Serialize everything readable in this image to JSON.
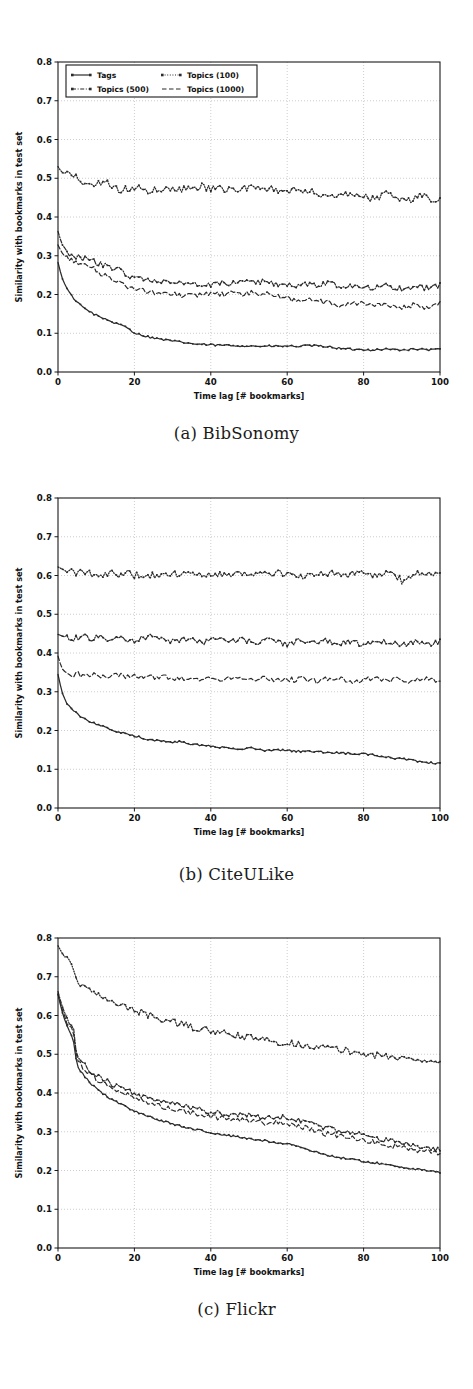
{
  "figure": {
    "panels": [
      {
        "id": "a",
        "caption": "(a) BibSonomy"
      },
      {
        "id": "b",
        "caption": "(b) CiteULike"
      },
      {
        "id": "c",
        "caption": "(c) Flickr"
      }
    ]
  },
  "axes": {
    "xlabel": "Time lag [# bookmarks]",
    "ylabel": "Similarity with bookmarks in test set",
    "xticks": [
      "0",
      "20",
      "40",
      "60",
      "80",
      "100"
    ],
    "yticks": [
      "0.0",
      "0.1",
      "0.2",
      "0.3",
      "0.4",
      "0.5",
      "0.6",
      "0.7",
      "0.8"
    ]
  },
  "legend": {
    "entries": [
      {
        "label": "Tags",
        "style": "solid-marker"
      },
      {
        "label": "Topics (100)",
        "style": "dotted-marker"
      },
      {
        "label": "Topics (500)",
        "style": "dashdot-marker"
      },
      {
        "label": "Topics (1000)",
        "style": "dashed"
      }
    ]
  },
  "colors": {
    "line": "#2b2b2b",
    "grid": "#b8b8b8",
    "frame": "#1a1a1a",
    "background": "#ffffff"
  },
  "chart_data": [
    {
      "type": "line",
      "title": "(a) BibSonomy",
      "xlabel": "Time lag [# bookmarks]",
      "ylabel": "Similarity with bookmarks in test set",
      "xlim": [
        0,
        100
      ],
      "ylim": [
        0.0,
        0.8
      ],
      "grid": true,
      "legend_position": "upper-left",
      "x": [
        0,
        1,
        2,
        3,
        4,
        5,
        6,
        7,
        8,
        9,
        10,
        12,
        14,
        16,
        18,
        20,
        22,
        24,
        26,
        28,
        30,
        32,
        34,
        36,
        38,
        40,
        42,
        44,
        46,
        48,
        50,
        52,
        54,
        56,
        58,
        60,
        62,
        64,
        66,
        68,
        70,
        72,
        74,
        76,
        78,
        80,
        82,
        84,
        86,
        88,
        90,
        92,
        94,
        96,
        98,
        100
      ],
      "series": [
        {
          "name": "Topics (100)",
          "values": [
            0.53,
            0.515,
            0.512,
            0.511,
            0.498,
            0.503,
            0.486,
            0.492,
            0.489,
            0.488,
            0.488,
            0.49,
            0.483,
            0.468,
            0.474,
            0.473,
            0.477,
            0.466,
            0.472,
            0.467,
            0.478,
            0.47,
            0.479,
            0.471,
            0.48,
            0.47,
            0.476,
            0.468,
            0.475,
            0.47,
            0.478,
            0.473,
            0.468,
            0.474,
            0.462,
            0.46,
            0.47,
            0.465,
            0.472,
            0.461,
            0.453,
            0.452,
            0.459,
            0.456,
            0.463,
            0.458,
            0.445,
            0.45,
            0.462,
            0.456,
            0.445,
            0.441,
            0.455,
            0.46,
            0.444,
            0.452
          ]
        },
        {
          "name": "Topics (500)",
          "values": [
            0.363,
            0.33,
            0.317,
            0.306,
            0.3,
            0.298,
            0.295,
            0.292,
            0.29,
            0.286,
            0.283,
            0.275,
            0.268,
            0.264,
            0.25,
            0.245,
            0.242,
            0.239,
            0.238,
            0.234,
            0.231,
            0.228,
            0.228,
            0.225,
            0.228,
            0.226,
            0.231,
            0.228,
            0.233,
            0.229,
            0.234,
            0.23,
            0.236,
            0.228,
            0.224,
            0.226,
            0.222,
            0.226,
            0.228,
            0.224,
            0.23,
            0.226,
            0.22,
            0.222,
            0.226,
            0.222,
            0.218,
            0.222,
            0.224,
            0.218,
            0.215,
            0.219,
            0.222,
            0.216,
            0.219,
            0.224
          ]
        },
        {
          "name": "Topics (1000)",
          "values": [
            0.328,
            0.308,
            0.296,
            0.29,
            0.287,
            0.283,
            0.28,
            0.275,
            0.272,
            0.268,
            0.262,
            0.25,
            0.243,
            0.236,
            0.222,
            0.215,
            0.212,
            0.207,
            0.205,
            0.203,
            0.201,
            0.198,
            0.2,
            0.197,
            0.2,
            0.199,
            0.203,
            0.199,
            0.204,
            0.198,
            0.205,
            0.2,
            0.206,
            0.197,
            0.194,
            0.19,
            0.184,
            0.188,
            0.186,
            0.182,
            0.18,
            0.176,
            0.172,
            0.175,
            0.178,
            0.174,
            0.17,
            0.173,
            0.176,
            0.17,
            0.166,
            0.17,
            0.174,
            0.168,
            0.17,
            0.175
          ]
        },
        {
          "name": "Tags",
          "values": [
            0.283,
            0.244,
            0.222,
            0.205,
            0.192,
            0.182,
            0.172,
            0.165,
            0.158,
            0.152,
            0.147,
            0.138,
            0.13,
            0.122,
            0.116,
            0.101,
            0.095,
            0.09,
            0.086,
            0.083,
            0.08,
            0.077,
            0.075,
            0.072,
            0.071,
            0.07,
            0.069,
            0.069,
            0.068,
            0.068,
            0.067,
            0.067,
            0.066,
            0.067,
            0.066,
            0.067,
            0.066,
            0.067,
            0.068,
            0.067,
            0.066,
            0.064,
            0.06,
            0.059,
            0.058,
            0.058,
            0.057,
            0.058,
            0.059,
            0.058,
            0.057,
            0.058,
            0.059,
            0.058,
            0.057,
            0.06
          ]
        }
      ]
    },
    {
      "type": "line",
      "title": "(b) CiteULike",
      "xlabel": "Time lag [# bookmarks]",
      "ylabel": "Similarity with bookmarks in test set",
      "xlim": [
        0,
        100
      ],
      "ylim": [
        0.0,
        0.8
      ],
      "grid": true,
      "legend_position": "none",
      "x": [
        0,
        1,
        2,
        3,
        4,
        5,
        6,
        7,
        8,
        9,
        10,
        12,
        14,
        16,
        18,
        20,
        22,
        24,
        26,
        28,
        30,
        32,
        34,
        36,
        38,
        40,
        42,
        44,
        46,
        48,
        50,
        52,
        54,
        56,
        58,
        60,
        62,
        64,
        66,
        68,
        70,
        72,
        74,
        76,
        78,
        80,
        82,
        84,
        86,
        88,
        90,
        92,
        94,
        96,
        98,
        100
      ],
      "series": [
        {
          "name": "Topics (100)",
          "values": [
            0.622,
            0.617,
            0.612,
            0.607,
            0.61,
            0.604,
            0.608,
            0.603,
            0.606,
            0.602,
            0.605,
            0.604,
            0.607,
            0.603,
            0.606,
            0.601,
            0.604,
            0.6,
            0.603,
            0.599,
            0.603,
            0.605,
            0.602,
            0.606,
            0.603,
            0.607,
            0.604,
            0.601,
            0.605,
            0.609,
            0.605,
            0.602,
            0.606,
            0.603,
            0.607,
            0.604,
            0.6,
            0.596,
            0.603,
            0.606,
            0.602,
            0.608,
            0.604,
            0.6,
            0.606,
            0.603,
            0.598,
            0.604,
            0.607,
            0.603,
            0.586,
            0.596,
            0.605,
            0.601,
            0.607,
            0.603
          ]
        },
        {
          "name": "Topics (500)",
          "values": [
            0.448,
            0.444,
            0.441,
            0.438,
            0.436,
            0.441,
            0.437,
            0.443,
            0.439,
            0.436,
            0.442,
            0.438,
            0.435,
            0.44,
            0.436,
            0.433,
            0.439,
            0.442,
            0.437,
            0.433,
            0.43,
            0.434,
            0.438,
            0.431,
            0.427,
            0.433,
            0.437,
            0.433,
            0.429,
            0.435,
            0.43,
            0.427,
            0.434,
            0.43,
            0.426,
            0.421,
            0.429,
            0.434,
            0.43,
            0.427,
            0.432,
            0.428,
            0.424,
            0.43,
            0.426,
            0.422,
            0.428,
            0.433,
            0.429,
            0.424,
            0.419,
            0.426,
            0.431,
            0.427,
            0.422,
            0.43
          ]
        },
        {
          "name": "Topics (1000)",
          "values": [
            0.392,
            0.36,
            0.35,
            0.346,
            0.344,
            0.348,
            0.342,
            0.347,
            0.341,
            0.345,
            0.34,
            0.344,
            0.338,
            0.343,
            0.337,
            0.341,
            0.336,
            0.34,
            0.335,
            0.339,
            0.334,
            0.338,
            0.333,
            0.337,
            0.332,
            0.336,
            0.331,
            0.335,
            0.338,
            0.333,
            0.328,
            0.334,
            0.338,
            0.333,
            0.329,
            0.334,
            0.33,
            0.335,
            0.331,
            0.327,
            0.333,
            0.329,
            0.334,
            0.33,
            0.326,
            0.331,
            0.336,
            0.332,
            0.328,
            0.333,
            0.329,
            0.325,
            0.331,
            0.335,
            0.331,
            0.327
          ]
        },
        {
          "name": "Tags",
          "values": [
            0.345,
            0.3,
            0.276,
            0.262,
            0.252,
            0.244,
            0.236,
            0.23,
            0.225,
            0.221,
            0.217,
            0.209,
            0.202,
            0.196,
            0.191,
            0.186,
            0.181,
            0.177,
            0.174,
            0.171,
            0.168,
            0.172,
            0.167,
            0.163,
            0.161,
            0.159,
            0.157,
            0.155,
            0.153,
            0.152,
            0.156,
            0.151,
            0.149,
            0.148,
            0.15,
            0.148,
            0.147,
            0.146,
            0.146,
            0.145,
            0.144,
            0.143,
            0.142,
            0.141,
            0.14,
            0.139,
            0.137,
            0.134,
            0.131,
            0.129,
            0.127,
            0.124,
            0.121,
            0.118,
            0.116,
            0.114
          ]
        }
      ]
    },
    {
      "type": "line",
      "title": "(c) Flickr",
      "xlabel": "Time lag [# bookmarks]",
      "ylabel": "Similarity with bookmarks in test set",
      "xlim": [
        0,
        100
      ],
      "ylim": [
        0.0,
        0.8
      ],
      "grid": true,
      "legend_position": "none",
      "x": [
        0,
        1,
        2,
        3,
        4,
        5,
        6,
        7,
        8,
        9,
        10,
        12,
        14,
        16,
        18,
        20,
        22,
        24,
        26,
        28,
        30,
        32,
        34,
        36,
        38,
        40,
        42,
        44,
        46,
        48,
        50,
        52,
        54,
        56,
        58,
        60,
        62,
        64,
        66,
        68,
        70,
        72,
        74,
        76,
        78,
        80,
        82,
        84,
        86,
        88,
        90,
        92,
        94,
        96,
        98,
        100
      ],
      "series": [
        {
          "name": "Topics (100)",
          "values": [
            0.78,
            0.762,
            0.748,
            0.735,
            0.724,
            0.692,
            0.681,
            0.673,
            0.666,
            0.66,
            0.654,
            0.644,
            0.635,
            0.628,
            0.621,
            0.614,
            0.607,
            0.6,
            0.594,
            0.588,
            0.583,
            0.578,
            0.573,
            0.568,
            0.564,
            0.56,
            0.556,
            0.552,
            0.549,
            0.546,
            0.543,
            0.54,
            0.537,
            0.534,
            0.532,
            0.529,
            0.527,
            0.524,
            0.522,
            0.52,
            0.517,
            0.514,
            0.511,
            0.508,
            0.505,
            0.502,
            0.499,
            0.496,
            0.494,
            0.492,
            0.49,
            0.488,
            0.487,
            0.485,
            0.484,
            0.483
          ]
        },
        {
          "name": "Topics (500)",
          "values": [
            0.662,
            0.626,
            0.601,
            0.582,
            0.566,
            0.494,
            0.482,
            0.471,
            0.462,
            0.454,
            0.447,
            0.435,
            0.424,
            0.415,
            0.407,
            0.4,
            0.393,
            0.387,
            0.381,
            0.376,
            0.371,
            0.367,
            0.363,
            0.359,
            0.355,
            0.352,
            0.349,
            0.347,
            0.345,
            0.343,
            0.342,
            0.34,
            0.337,
            0.335,
            0.337,
            0.336,
            0.334,
            0.329,
            0.322,
            0.316,
            0.311,
            0.306,
            0.302,
            0.299,
            0.296,
            0.293,
            0.288,
            0.283,
            0.279,
            0.275,
            0.271,
            0.267,
            0.263,
            0.259,
            0.256,
            0.253
          ]
        },
        {
          "name": "Topics (1000)",
          "values": [
            0.655,
            0.618,
            0.592,
            0.572,
            0.555,
            0.487,
            0.474,
            0.463,
            0.453,
            0.445,
            0.437,
            0.424,
            0.413,
            0.404,
            0.396,
            0.388,
            0.381,
            0.375,
            0.369,
            0.364,
            0.359,
            0.355,
            0.351,
            0.347,
            0.343,
            0.34,
            0.337,
            0.334,
            0.332,
            0.33,
            0.329,
            0.327,
            0.324,
            0.322,
            0.324,
            0.322,
            0.319,
            0.313,
            0.306,
            0.3,
            0.295,
            0.291,
            0.288,
            0.285,
            0.282,
            0.279,
            0.275,
            0.271,
            0.267,
            0.263,
            0.26,
            0.256,
            0.253,
            0.25,
            0.248,
            0.246
          ]
        },
        {
          "name": "Tags",
          "values": [
            0.655,
            0.612,
            0.582,
            0.558,
            0.538,
            0.47,
            0.455,
            0.442,
            0.431,
            0.421,
            0.412,
            0.397,
            0.384,
            0.373,
            0.363,
            0.354,
            0.346,
            0.339,
            0.332,
            0.326,
            0.32,
            0.315,
            0.31,
            0.306,
            0.302,
            0.298,
            0.294,
            0.291,
            0.288,
            0.285,
            0.282,
            0.279,
            0.277,
            0.274,
            0.272,
            0.269,
            0.265,
            0.259,
            0.252,
            0.246,
            0.241,
            0.237,
            0.233,
            0.23,
            0.227,
            0.224,
            0.221,
            0.218,
            0.215,
            0.212,
            0.209,
            0.206,
            0.203,
            0.2,
            0.197,
            0.195
          ]
        }
      ]
    }
  ]
}
